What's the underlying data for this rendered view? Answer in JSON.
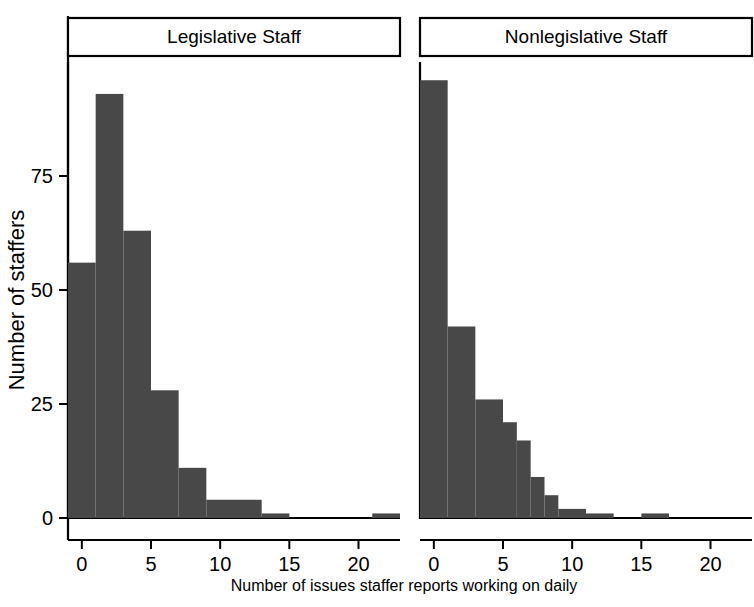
{
  "chart_data": {
    "type": "bar",
    "title": "",
    "subtitle": "",
    "xlabel": "Number of issues staffer reports working on daily",
    "ylabel": "Number of staffers",
    "grid": false,
    "legend": "none",
    "layout": "two side-by-side histogram panels with strip labels on top",
    "bin_width": 1,
    "xlim": [
      -1,
      23
    ],
    "ylim": [
      0,
      100
    ],
    "y_ticks": [
      0,
      25,
      50,
      75
    ],
    "y_tick_labels": [
      "0",
      "25",
      "50",
      "75"
    ],
    "panels": [
      {
        "name": "legislative",
        "label": "Legislative Staff",
        "x_ticks": [
          0,
          5,
          10,
          15,
          20
        ],
        "x_tick_labels": [
          "0",
          "5",
          "10",
          "15",
          "20"
        ],
        "bars": [
          {
            "x0": -1,
            "x1": 1,
            "value": 56
          },
          {
            "x0": 1,
            "x1": 3,
            "value": 93
          },
          {
            "x0": 3,
            "x1": 5,
            "value": 63
          },
          {
            "x0": 5,
            "x1": 7,
            "value": 28
          },
          {
            "x0": 7,
            "x1": 9,
            "value": 11
          },
          {
            "x0": 9,
            "x1": 13,
            "value": 4
          },
          {
            "x0": 13,
            "x1": 15,
            "value": 1
          },
          {
            "x0": 21,
            "x1": 23,
            "value": 1
          }
        ]
      },
      {
        "name": "nonlegislative",
        "label": "Nonlegislative Staff",
        "x_ticks": [
          0,
          5,
          10,
          15,
          20
        ],
        "x_tick_labels": [
          "0",
          "5",
          "10",
          "15",
          "20"
        ],
        "bars": [
          {
            "x0": -1,
            "x1": 1,
            "value": 96
          },
          {
            "x0": 1,
            "x1": 3,
            "value": 42
          },
          {
            "x0": 3,
            "x1": 5,
            "value": 26
          },
          {
            "x0": 5,
            "x1": 6,
            "value": 21
          },
          {
            "x0": 6,
            "x1": 7,
            "value": 17
          },
          {
            "x0": 7,
            "x1": 8,
            "value": 9
          },
          {
            "x0": 8,
            "x1": 9,
            "value": 5
          },
          {
            "x0": 9,
            "x1": 11,
            "value": 2
          },
          {
            "x0": 11,
            "x1": 13,
            "value": 1
          },
          {
            "x0": 15,
            "x1": 17,
            "value": 1
          }
        ]
      }
    ],
    "colors": {
      "bar_fill": "#484848",
      "axis": "#000000",
      "background": "#ffffff"
    }
  }
}
